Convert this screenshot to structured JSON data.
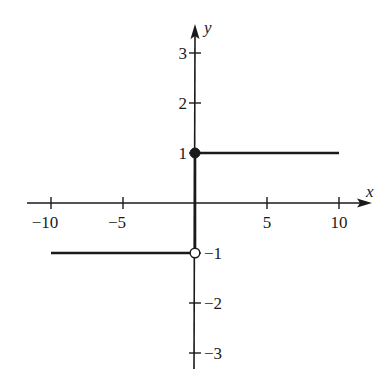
{
  "chart_data": {
    "type": "line",
    "title": "",
    "xlabel": "x",
    "ylabel": "y",
    "xlim": [
      -11.5,
      12.5
    ],
    "ylim": [
      -3.3,
      3.6
    ],
    "grid": false,
    "legend": null,
    "x_ticks": [
      -10,
      -5,
      5,
      10
    ],
    "x_tick_labels": [
      "−10",
      "−5",
      "5",
      "10"
    ],
    "y_ticks": [
      3,
      2,
      1,
      -1,
      -2,
      -3
    ],
    "y_tick_labels": [
      "3",
      "2",
      "1",
      "−1",
      "−2",
      "−3"
    ],
    "series": [
      {
        "name": "f(x) = 1 for x ≥ 0",
        "x": [
          0,
          10
        ],
        "y": [
          1,
          1
        ],
        "endpoint_left": "closed"
      },
      {
        "name": "f(x) = -1 for x < 0",
        "x": [
          -10,
          0
        ],
        "y": [
          -1,
          -1
        ],
        "endpoint_right": "open"
      },
      {
        "name": "vertical jump segment",
        "x": [
          0,
          0
        ],
        "y": [
          -1,
          1
        ]
      }
    ],
    "annotations": [
      {
        "type": "closed-dot",
        "x": 0,
        "y": 1
      },
      {
        "type": "open-dot",
        "x": 0,
        "y": -1
      }
    ]
  },
  "colors": {
    "ink": "#1a1a1a",
    "background": "#ffffff"
  }
}
